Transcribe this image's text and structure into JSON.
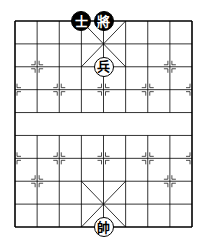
{
  "board": {
    "cols": 9,
    "rows": 10,
    "origin_x": 15,
    "origin_y": 21,
    "width": 177,
    "height": 206,
    "line_color": "#000000",
    "background": "#ffffff"
  },
  "pieces": [
    {
      "name": "black-advisor",
      "char": "士",
      "side": "black",
      "col": 3,
      "row": 0
    },
    {
      "name": "black-general",
      "char": "將",
      "side": "black",
      "col": 4,
      "row": 0
    },
    {
      "name": "red-soldier",
      "char": "兵",
      "side": "red",
      "col": 4,
      "row": 2
    },
    {
      "name": "red-general",
      "char": "帥",
      "side": "red",
      "col": 4,
      "row": 9
    }
  ],
  "markers": [
    {
      "col": 1,
      "row": 2
    },
    {
      "col": 7,
      "row": 2
    },
    {
      "col": 0,
      "row": 3
    },
    {
      "col": 2,
      "row": 3
    },
    {
      "col": 4,
      "row": 3
    },
    {
      "col": 6,
      "row": 3
    },
    {
      "col": 8,
      "row": 3
    },
    {
      "col": 0,
      "row": 6
    },
    {
      "col": 2,
      "row": 6
    },
    {
      "col": 4,
      "row": 6
    },
    {
      "col": 6,
      "row": 6
    },
    {
      "col": 8,
      "row": 6
    },
    {
      "col": 1,
      "row": 7
    },
    {
      "col": 7,
      "row": 7
    }
  ]
}
